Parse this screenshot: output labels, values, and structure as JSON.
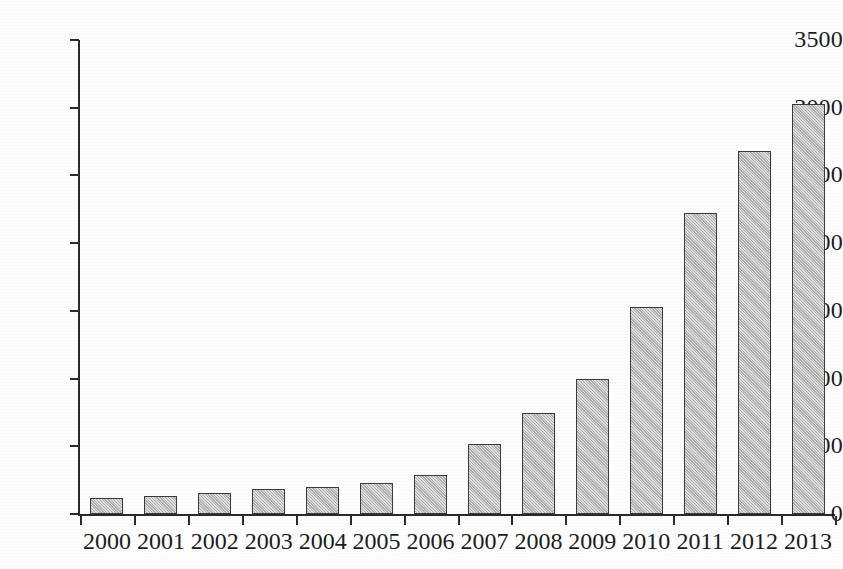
{
  "chart_data": {
    "type": "bar",
    "title": "",
    "subtitle": "",
    "xlabel": "",
    "ylabel": "",
    "categories": [
      "2000",
      "2001",
      "2002",
      "2003",
      "2004",
      "2005",
      "2006",
      "2007",
      "2008",
      "2009",
      "2010",
      "2011",
      "2012",
      "2013"
    ],
    "values": [
      120,
      130,
      155,
      185,
      200,
      230,
      290,
      515,
      745,
      1000,
      1525,
      2225,
      2680,
      3025
    ],
    "series": [
      {
        "name": "",
        "values": [
          120,
          130,
          155,
          185,
          200,
          230,
          290,
          515,
          745,
          1000,
          1525,
          2225,
          2680,
          3025
        ]
      }
    ],
    "ylim": [
      0,
      3500
    ],
    "yticks": [
      0,
      500,
      1000,
      1500,
      2000,
      2500,
      3000,
      3500
    ],
    "ytick_labels": [
      "0",
      "500",
      "1000",
      "1500",
      "2000",
      "2500",
      "3000",
      "3500"
    ],
    "xtick_labels": [
      "2000",
      "2001",
      "2002",
      "2003",
      "2004",
      "2005",
      "2006",
      "2007",
      "2008",
      "2009",
      "2010",
      "2011",
      "2012",
      "2013"
    ],
    "grid": false,
    "legend": false,
    "legend_position": "none",
    "annotations": [],
    "colors": {
      "bar_fill": "#bdbdbd",
      "bar_stroke": "#3a3a3a",
      "axis": "#2b2b2b",
      "text": "#1c1c1c",
      "background": "#fefefe"
    }
  }
}
